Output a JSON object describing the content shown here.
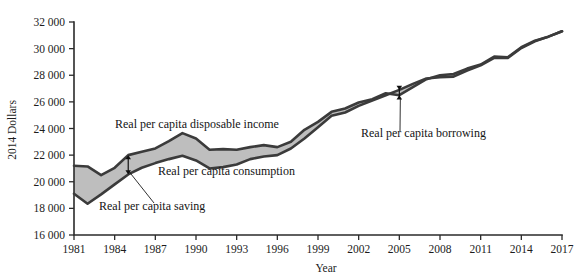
{
  "chart_data": {
    "type": "area",
    "title": "",
    "xlabel": "Year",
    "ylabel": "2014 Dollars",
    "xlim": [
      1981,
      2017
    ],
    "ylim": [
      16000,
      32000
    ],
    "grid": false,
    "legend": "inline-annotations",
    "x_ticks": [
      "1981",
      "1984",
      "1987",
      "1990",
      "1993",
      "1996",
      "1999",
      "2002",
      "2005",
      "2008",
      "2011",
      "2014",
      "2017"
    ],
    "y_ticks": [
      "16 000",
      "18 000",
      "20 000",
      "22 000",
      "24 000",
      "26 000",
      "28 000",
      "30 000",
      "32 000"
    ],
    "x": [
      1981,
      1982,
      1983,
      1984,
      1985,
      1986,
      1987,
      1988,
      1989,
      1990,
      1991,
      1992,
      1993,
      1994,
      1995,
      1996,
      1997,
      1998,
      1999,
      2000,
      2001,
      2002,
      2003,
      2004,
      2005,
      2006,
      2007,
      2008,
      2009,
      2010,
      2011,
      2012,
      2013,
      2014,
      2015,
      2016,
      2017
    ],
    "series": [
      {
        "name": "Real per capita disposable income",
        "values": [
          21200,
          21150,
          20500,
          21050,
          22000,
          22250,
          22500,
          23050,
          23650,
          23250,
          22400,
          22450,
          22400,
          22600,
          22750,
          22600,
          23000,
          23900,
          24500,
          25250,
          25500,
          25950,
          26200,
          26650,
          26500,
          27100,
          27700,
          28000,
          28100,
          28500,
          28800,
          29400,
          29350,
          30100,
          30600,
          30900,
          31300
        ]
      },
      {
        "name": "Real per capita consumption",
        "values": [
          19100,
          18350,
          19050,
          19800,
          20550,
          21050,
          21400,
          21700,
          21950,
          21600,
          21000,
          21100,
          21300,
          21700,
          21900,
          22000,
          22500,
          23250,
          24100,
          24950,
          25200,
          25700,
          26100,
          26500,
          26900,
          27350,
          27750,
          27850,
          27900,
          28350,
          28750,
          29300,
          29300,
          30050,
          30550,
          30900,
          31300
        ]
      }
    ],
    "annotations": [
      {
        "name": "income-label",
        "text": "Real per capita disposable income",
        "x_px": 115,
        "y_px": 128
      },
      {
        "name": "consumption-label",
        "text": "Real per capita consumption",
        "x_px": 158,
        "y_px": 175
      },
      {
        "name": "saving-label",
        "text": "Real per capita saving",
        "x_px": 99,
        "y_px": 210
      },
      {
        "name": "borrowing-label",
        "text": "Real per capita borrowing",
        "x_px": 361,
        "y_px": 137
      }
    ]
  },
  "axes": {
    "y_axis_title": "2014 Dollars",
    "x_axis_title": "Year"
  },
  "colors": {
    "band": "#b9b9b9",
    "line": "#3b3b3b",
    "axis": "#2b2b2b",
    "text": "#141414",
    "background": "#ffffff"
  }
}
